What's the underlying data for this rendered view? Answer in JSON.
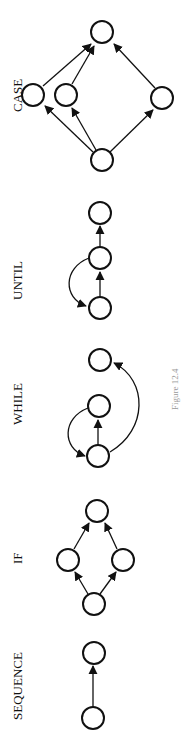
{
  "figure": {
    "caption": "Figure 12.4",
    "orientation": "rotated 90° counter-clockwise",
    "diagrams": [
      {
        "id": "sequence",
        "label": "SEQUENCE",
        "nodes": [
          "s1",
          "s2"
        ],
        "edges": [
          {
            "from": "s1",
            "to": "s2",
            "type": "straight"
          }
        ]
      },
      {
        "id": "if",
        "label": "IF",
        "nodes": [
          "i1",
          "i2",
          "i3",
          "i4"
        ],
        "edges": [
          {
            "from": "i1",
            "to": "i2",
            "type": "straight"
          },
          {
            "from": "i1",
            "to": "i3",
            "type": "straight"
          },
          {
            "from": "i2",
            "to": "i4",
            "type": "straight"
          },
          {
            "from": "i3",
            "to": "i4",
            "type": "straight"
          }
        ]
      },
      {
        "id": "while",
        "label": "WHILE",
        "nodes": [
          "w1",
          "w2",
          "w3"
        ],
        "edges": [
          {
            "from": "w1",
            "to": "w2",
            "type": "straight"
          },
          {
            "from": "w2",
            "to": "w1",
            "type": "curved"
          },
          {
            "from": "w1",
            "to": "w3",
            "type": "curved"
          }
        ]
      },
      {
        "id": "until",
        "label": "UNTIL",
        "nodes": [
          "u1",
          "u2",
          "u3"
        ],
        "edges": [
          {
            "from": "u1",
            "to": "u2",
            "type": "straight"
          },
          {
            "from": "u2",
            "to": "u1",
            "type": "curved"
          },
          {
            "from": "u2",
            "to": "u3",
            "type": "straight"
          }
        ]
      },
      {
        "id": "case",
        "label": "CASE",
        "nodes": [
          "c1",
          "c2",
          "c3",
          "c4",
          "c5"
        ],
        "edges": [
          {
            "from": "c1",
            "to": "c2",
            "type": "straight"
          },
          {
            "from": "c1",
            "to": "c3",
            "type": "straight"
          },
          {
            "from": "c1",
            "to": "c4",
            "type": "straight"
          },
          {
            "from": "c2",
            "to": "c5",
            "type": "straight"
          },
          {
            "from": "c3",
            "to": "c5",
            "type": "straight"
          },
          {
            "from": "c4",
            "to": "c5",
            "type": "straight"
          }
        ]
      }
    ]
  }
}
